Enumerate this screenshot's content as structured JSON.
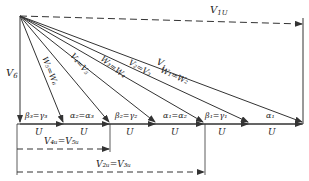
{
  "diagram": {
    "line_color": "#333333",
    "labels": {
      "v1u": "V",
      "v1u_sub": "1U",
      "v6": "V",
      "v6_sub": "6",
      "v1": "V",
      "v1_sub": "1",
      "w1w2": "W₁=W₂",
      "v2v3": "V₂=V₃",
      "w3w4": "W₃=W₄",
      "v4v5": "V₄=V₅",
      "w5w6": "W₅=W₆",
      "v4u_v5u": "V₄ᵤ=V₅ᵤ",
      "v2u_v3u": "V₂ᵤ=V₃ᵤ",
      "angles": [
        "β₃=γ₃",
        "α₂=α₃",
        "β₂=γ₂",
        "α₁=α₂",
        "β₁=γ₁",
        "α₁"
      ],
      "u": "U"
    }
  }
}
